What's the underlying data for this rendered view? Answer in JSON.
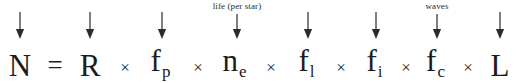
{
  "equation": {
    "name": "drake-equation",
    "left_side": {
      "symbol": "N",
      "x": 20
    },
    "equals_sign": {
      "symbol": "=",
      "x": 55
    },
    "terms": [
      {
        "id": "r",
        "base": "R",
        "sub": "",
        "x": 90,
        "arrow_x": 90,
        "annotation": ""
      },
      {
        "id": "fp",
        "base": "f",
        "sub": "p",
        "x": 160,
        "arrow_x": 162,
        "annotation": ""
      },
      {
        "id": "ne",
        "base": "n",
        "sub": "e",
        "x": 234,
        "arrow_x": 237,
        "annotation": "life (per star)"
      },
      {
        "id": "fl",
        "base": "f",
        "sub": "l",
        "x": 306,
        "arrow_x": 308,
        "annotation": ""
      },
      {
        "id": "fi",
        "base": "f",
        "sub": "i",
        "x": 374,
        "arrow_x": 376,
        "annotation": ""
      },
      {
        "id": "fc",
        "base": "f",
        "sub": "c",
        "x": 435,
        "arrow_x": 437,
        "annotation": "waves"
      },
      {
        "id": "l",
        "base": "L",
        "sub": "",
        "x": 500,
        "arrow_x": 500,
        "annotation": ""
      }
    ],
    "multiply_signs": [
      {
        "symbol": "×",
        "x": 125
      },
      {
        "symbol": "×",
        "x": 198
      },
      {
        "symbol": "×",
        "x": 271
      },
      {
        "symbol": "×",
        "x": 341
      },
      {
        "symbol": "×",
        "x": 406
      },
      {
        "symbol": "×",
        "x": 468
      }
    ]
  },
  "annotations": [
    {
      "text": "life (per star)",
      "x": 237
    },
    {
      "text": "waves",
      "x": 437
    }
  ],
  "arrows": [
    {
      "id": "arrow-n",
      "x": 20,
      "top": 12,
      "height": 27
    },
    {
      "id": "arrow-r",
      "x": 90,
      "top": 12,
      "height": 27
    },
    {
      "id": "arrow-fp",
      "x": 162,
      "top": 12,
      "height": 27
    },
    {
      "id": "arrow-ne",
      "x": 237,
      "top": 14,
      "height": 25
    },
    {
      "id": "arrow-fl",
      "x": 308,
      "top": 12,
      "height": 27
    },
    {
      "id": "arrow-fi",
      "x": 376,
      "top": 12,
      "height": 27
    },
    {
      "id": "arrow-fc",
      "x": 437,
      "top": 14,
      "height": 25
    },
    {
      "id": "arrow-l",
      "x": 500,
      "top": 12,
      "height": 27
    }
  ],
  "colors": {
    "background": "#ffffff",
    "text": "#1c1c1c",
    "arrow": "#2b2b2b",
    "annotation": "#2a2a2a"
  }
}
